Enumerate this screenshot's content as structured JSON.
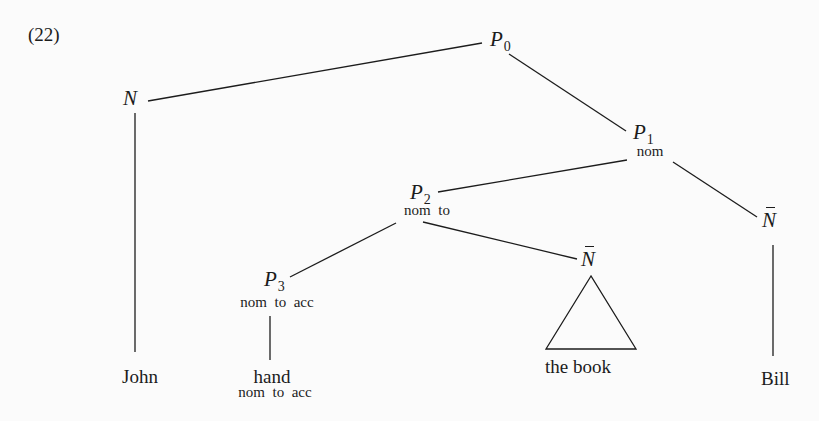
{
  "example_number": "(22)",
  "nodes": {
    "p0": {
      "cat": "P",
      "sub": "0"
    },
    "n_john": {
      "cat": "N"
    },
    "p1": {
      "cat": "P",
      "sub": "1",
      "features": "nom"
    },
    "p2": {
      "cat": "P",
      "sub": "2",
      "features": "nom  to"
    },
    "p3": {
      "cat": "P",
      "sub": "3",
      "features": "nom  to  acc"
    },
    "nbar_book": {
      "cat": "N"
    },
    "nbar_bill": {
      "cat": "N"
    }
  },
  "leaves": {
    "john": "John",
    "hand": "hand",
    "hand_features": "nom  to  acc",
    "the_book": "the book",
    "bill": "Bill"
  }
}
